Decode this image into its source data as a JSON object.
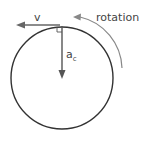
{
  "diagram": {
    "labels": {
      "velocity": "v",
      "accel_main": "a",
      "accel_sub": "c",
      "rotation": "rotation"
    },
    "colors": {
      "circle": "#333333",
      "velocity_arrow": "#666666",
      "accel_arrow": "#555555",
      "rotation_arrow": "#888888",
      "text": "#444444"
    }
  }
}
